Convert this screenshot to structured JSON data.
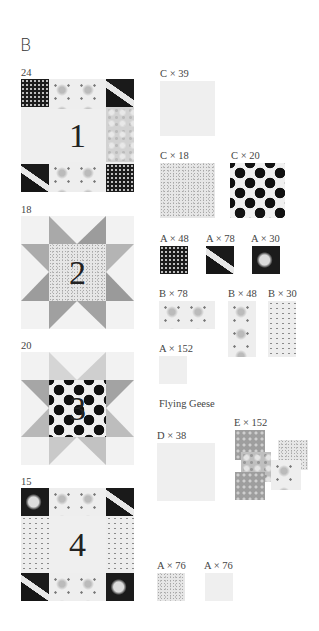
{
  "section": {
    "letter": "B"
  },
  "blocks": [
    {
      "count": "24",
      "number": "1",
      "type": "framed-square"
    },
    {
      "count": "18",
      "number": "2",
      "type": "sawtooth-star"
    },
    {
      "count": "20",
      "number": "3",
      "type": "sawtooth-star"
    },
    {
      "count": "15",
      "number": "4",
      "type": "framed-square"
    }
  ],
  "swatches": [
    {
      "label": "C × 39",
      "fabric": "plain-light"
    },
    {
      "label": "C × 18",
      "fabric": "speckle-gray"
    },
    {
      "label": "C × 20",
      "fabric": "large-polka-dot"
    },
    {
      "label": "A × 48",
      "fabric": "dark-small-flower"
    },
    {
      "label": "A × 78",
      "fabric": "dark-leaf"
    },
    {
      "label": "A × 30",
      "fabric": "dark-medallion"
    },
    {
      "label": "B × 78",
      "fabric": "light-floral"
    },
    {
      "label": "B × 48",
      "fabric": "light-floral-vertical"
    },
    {
      "label": "B × 30",
      "fabric": "star-dots"
    },
    {
      "label": "A × 152",
      "fabric": "plain-light"
    },
    {
      "label": "D × 38",
      "fabric": "plain-light"
    },
    {
      "label": "E × 152",
      "fabric": "assorted-gray-prints"
    },
    {
      "label": "A × 76",
      "fabric": "speckle-gray"
    },
    {
      "label": "A × 76",
      "fabric": "plain-light"
    }
  ],
  "flying_geese": {
    "heading": "Flying Geese"
  }
}
